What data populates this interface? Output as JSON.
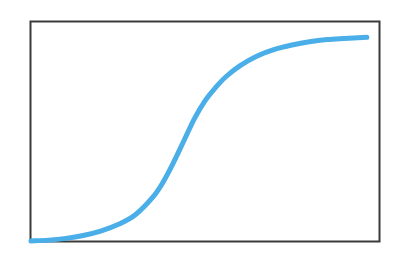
{
  "chart_data": {
    "type": "line",
    "title": "",
    "xlabel": "",
    "ylabel": "",
    "xlim": [
      0,
      1
    ],
    "ylim": [
      0,
      1
    ],
    "grid": false,
    "legend": "none",
    "line_color": "#4aaee8",
    "frame_color": "#3a3a3a",
    "series": [
      {
        "name": "sigmoid",
        "x": [
          0.0,
          0.05,
          0.1,
          0.15,
          0.2,
          0.25,
          0.3,
          0.35,
          0.38,
          0.41,
          0.44,
          0.47,
          0.5,
          0.53,
          0.56,
          0.6,
          0.65,
          0.7,
          0.75,
          0.8,
          0.85,
          0.9,
          0.965
        ],
        "y": [
          0.0,
          0.004,
          0.012,
          0.025,
          0.045,
          0.075,
          0.12,
          0.2,
          0.27,
          0.36,
          0.46,
          0.56,
          0.64,
          0.7,
          0.75,
          0.8,
          0.845,
          0.875,
          0.895,
          0.91,
          0.92,
          0.925,
          0.93
        ]
      }
    ]
  }
}
